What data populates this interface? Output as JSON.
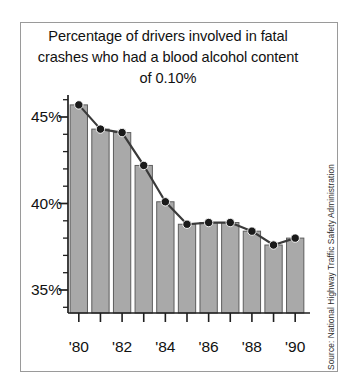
{
  "chart_data": {
    "type": "bar",
    "title": "Percentage of drivers involved in fatal crashes who had a blood alcohol content of 0.10%",
    "title_lines": [
      "Percentage of drivers involved in fatal",
      "crashes who had a blood alcohol content",
      "of 0.10%"
    ],
    "categories": [
      "'80",
      "'81",
      "'82",
      "'83",
      "'84",
      "'85",
      "'86",
      "'87",
      "'88",
      "'89",
      "'90"
    ],
    "values": [
      45.7,
      44.3,
      44.1,
      42.2,
      40.1,
      38.8,
      38.9,
      38.9,
      38.4,
      37.6,
      38.0
    ],
    "series": [
      {
        "name": "Percent of fatal-crash drivers with BAC 0.10%",
        "values": [
          45.7,
          44.3,
          44.1,
          42.2,
          40.1,
          38.8,
          38.9,
          38.9,
          38.4,
          37.6,
          38.0
        ]
      }
    ],
    "overlay": "line-with-markers",
    "xlabel": "",
    "ylabel": "",
    "ylim": [
      34.1,
      46.4
    ],
    "xlim_years": [
      1980,
      1990
    ],
    "y_major_ticks": [
      35,
      40,
      45
    ],
    "y_major_tick_labels": [
      "35%",
      "40%",
      "45%"
    ],
    "y_minor_tick_step": 1,
    "x_tick_labels_shown": [
      "'80",
      "'82",
      "'84",
      "'86",
      "'88",
      "'90"
    ],
    "x_ticks_all_years": [
      "'80",
      "'81",
      "'82",
      "'83",
      "'84",
      "'85",
      "'86",
      "'87",
      "'88",
      "'89",
      "'90"
    ],
    "grid": false,
    "legend": "none",
    "source": "Source: National Highway Traffic Safety Administration",
    "colors": {
      "bar_fill": "#a9a9a9",
      "bar_edge": "#5d5d5d",
      "line": "#3a3a3a",
      "marker": "#1a1a1a",
      "axis": "#1f1f1f",
      "frame": "#9a9a9a",
      "background": "#ffffff",
      "text": "#111111"
    }
  },
  "axis": {
    "y_labels": [
      "45%",
      "40%",
      "35%"
    ],
    "x_labels": [
      "'80",
      "'82",
      "'84",
      "'86",
      "'88",
      "'90"
    ]
  },
  "source_note": "Source: National Highway Traffic Safety Administration"
}
